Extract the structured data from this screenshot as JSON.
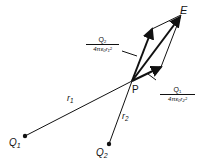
{
  "diagram": {
    "points": {
      "E": {
        "label": "E",
        "x": 181,
        "y": 15
      },
      "P": {
        "label": "P",
        "x": 132,
        "y": 81
      },
      "Q1": {
        "label": "Q",
        "sub": "1",
        "x": 25,
        "y": 136
      },
      "Q2": {
        "label": "Q",
        "sub": "2",
        "x": 109,
        "y": 144
      }
    },
    "distances": {
      "r1": {
        "label": "r",
        "sub": "1"
      },
      "r2": {
        "label": "r",
        "sub": "2"
      }
    },
    "vectors": {
      "field_from_Q2": {
        "numerator": "Q₂",
        "denominator": "4πε₀r₁²"
      },
      "field_from_Q1": {
        "numerator": "Q₁",
        "denominator": "4πε₀r₂²"
      }
    }
  }
}
